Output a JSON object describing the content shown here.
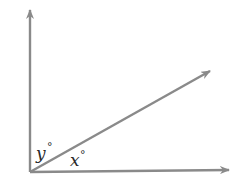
{
  "diagram": {
    "type": "angle-diagram",
    "colors": {
      "ray": "#8a8a8a",
      "text": "#2a2a2a",
      "background": "#ffffff"
    },
    "labels": {
      "angle_y": "y",
      "angle_x": "x",
      "degree_symbol": "°"
    },
    "rays": [
      {
        "name": "vertical-ray",
        "direction": "up"
      },
      {
        "name": "diagonal-ray",
        "direction": "up-right"
      },
      {
        "name": "horizontal-ray",
        "direction": "right"
      }
    ]
  }
}
